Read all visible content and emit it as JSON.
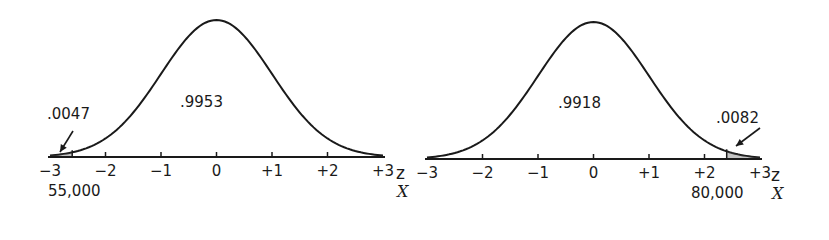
{
  "panels": [
    {
      "id": "left",
      "center_area_label": ".9953",
      "tail_area_label": ".0047",
      "tail_side": "left",
      "cutoff_z": -2.6,
      "x_value_label": "55,000",
      "z_ticks": [
        "-3",
        "-2",
        "-1",
        "0",
        "+1",
        "+2",
        "+3"
      ],
      "z_axis_name": "z",
      "x_axis_name": "X"
    },
    {
      "id": "right",
      "center_area_label": ".9918",
      "tail_area_label": ".0082",
      "tail_side": "right",
      "cutoff_z": 2.4,
      "x_value_label": "80,000",
      "z_ticks": [
        "-3",
        "-2",
        "-1",
        "0",
        "+1",
        "+2",
        "+3"
      ],
      "z_axis_name": "z",
      "x_axis_name": "X"
    }
  ],
  "colors": {
    "ink": "#1a1a1a",
    "background": "#ffffff"
  }
}
